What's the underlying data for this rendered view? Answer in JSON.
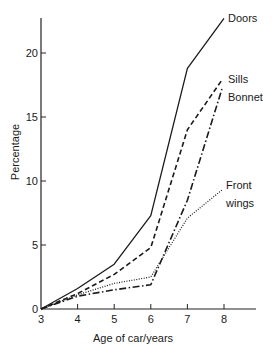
{
  "chart_data": {
    "type": "line",
    "title": "",
    "xlabel": "Age of car/years",
    "ylabel": "Percentage",
    "x": [
      3,
      4,
      5,
      6,
      7,
      8
    ],
    "xlim": [
      3,
      8.8
    ],
    "ylim": [
      0,
      23
    ],
    "xticks": [
      "3",
      "4",
      "5",
      "6",
      "7",
      "8"
    ],
    "yticks": [
      "0",
      "5",
      "10",
      "15",
      "20"
    ],
    "grid": false,
    "legend_position": "inline labels at line ends",
    "series": [
      {
        "name": "Doors",
        "style": "solid",
        "values": [
          0,
          1.6,
          3.5,
          7.3,
          18.8,
          22.7
        ]
      },
      {
        "name": "Sills",
        "style": "dashed",
        "values": [
          0,
          1.2,
          2.7,
          4.8,
          14.0,
          17.9
        ]
      },
      {
        "name": "Bonnet",
        "style": "dash-dot",
        "values": [
          0,
          1.0,
          1.5,
          1.9,
          8.5,
          17.2
        ]
      },
      {
        "name": "Front wings",
        "style": "dotted",
        "values": [
          0,
          1.1,
          2.0,
          2.5,
          7.1,
          9.3
        ]
      }
    ]
  }
}
